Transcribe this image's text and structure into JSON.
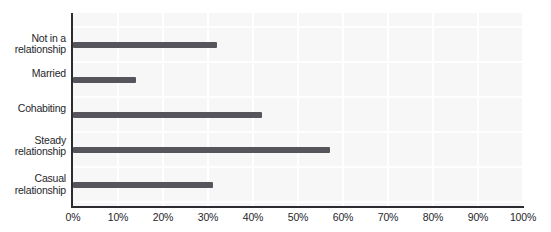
{
  "chart_data": {
    "type": "bar",
    "orientation": "horizontal",
    "title": "",
    "xlabel": "",
    "ylabel": "",
    "categories": [
      "Not in a relationship",
      "Married",
      "Cohabiting",
      "Steady relationship",
      "Casual relationship"
    ],
    "category_labels": [
      "Not in a\nrelationship",
      "Married",
      "Cohabiting",
      "Steady\nrelationship",
      "Casual\nrelationship"
    ],
    "values": [
      32,
      14,
      42,
      57,
      31
    ],
    "unit": "%",
    "xlim": [
      0,
      100
    ],
    "x_ticks": [
      "0%",
      "10%",
      "20%",
      "30%",
      "40%",
      "50%",
      "60%",
      "70%",
      "80%",
      "90%",
      "100%"
    ],
    "grid": "on",
    "legend": "none",
    "colors": {
      "bar": "#55555b",
      "plot_background": "#f7f7f7",
      "gridline": "#ffffff",
      "axis": "#2c2c31",
      "text": "#26262b"
    }
  }
}
